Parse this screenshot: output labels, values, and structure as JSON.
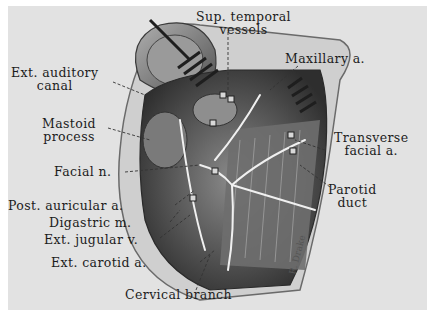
{
  "figure": {
    "type": "anatomical illustration",
    "colors": {
      "paper": "#e2e2e2",
      "border": "#ffffff",
      "ink": "#1c1c1c"
    },
    "signature": "R. Drake"
  },
  "labels": {
    "sup_temporal_line1": "Sup. temporal",
    "sup_temporal_line2": "vessels",
    "maxillary": "Maxillary a.",
    "ext_auditory_line1": "Ext. auditory",
    "ext_auditory_line2": "canal",
    "mastoid_line1": "Mastoid",
    "mastoid_line2": "process",
    "transverse_line1": "Transverse",
    "transverse_line2": "facial a.",
    "facial_n": "Facial n.",
    "parotid_line1": "Parotid",
    "parotid_line2": "duct",
    "post_auricular": "Post. auricular a.",
    "digastric": "Digastric m.",
    "ext_jugular": "Ext. jugular v.",
    "ext_carotid": "Ext. carotid a.",
    "cervical_branch": "Cervical branch"
  }
}
